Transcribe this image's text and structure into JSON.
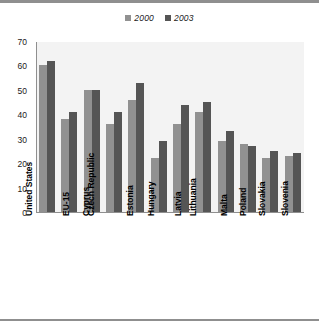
{
  "chart_data": {
    "type": "bar",
    "title": "",
    "subtitle": "",
    "xlabel": "",
    "ylabel": "",
    "ylim": [
      0,
      70
    ],
    "yticks": [
      0,
      10,
      20,
      30,
      40,
      50,
      60,
      70
    ],
    "grid": true,
    "legend_position": "top-center",
    "categories": [
      "United States",
      "EU-15",
      "Cyprus",
      "Czech Republic",
      "Estonia",
      "Hungary",
      "Latvia",
      "Lithuania",
      "Malta",
      "Poland",
      "Slovakia",
      "Slovenia"
    ],
    "series": [
      {
        "name": "2000",
        "color": "#919191",
        "values": [
          60,
          38,
          50,
          36,
          46,
          22,
          36,
          41,
          29,
          28,
          22,
          23
        ]
      },
      {
        "name": "2003",
        "color": "#555555",
        "values": [
          62,
          41,
          50,
          41,
          53,
          29,
          44,
          45,
          33,
          27,
          25,
          24
        ]
      }
    ]
  },
  "legend": {
    "items": [
      {
        "label": "2000",
        "color": "#919191"
      },
      {
        "label": "2003",
        "color": "#555555"
      }
    ]
  },
  "axes": {
    "y": {
      "ticks": [
        "70",
        "60",
        "50",
        "40",
        "30",
        "20",
        "10",
        "0"
      ]
    }
  },
  "colors": {
    "series_2000": "#919191",
    "series_2003": "#555555",
    "gridline": "#a8a8a8",
    "frame": "#8f8f8f",
    "band_shade": "#f3f3f3",
    "background": "#ffffff"
  }
}
